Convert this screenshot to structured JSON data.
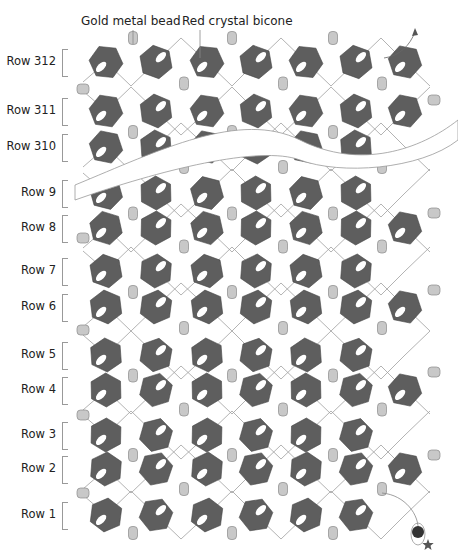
{
  "callouts": {
    "gold_bead": "Gold metal bead",
    "red_bicone": "Red crystal bicone"
  },
  "rows": [
    {
      "label": "Row 312",
      "y": 62
    },
    {
      "label": "Row 311",
      "y": 111
    },
    {
      "label": "Row 310",
      "y": 147
    },
    {
      "label": "Row 9",
      "y": 193
    },
    {
      "label": "Row 8",
      "y": 228
    },
    {
      "label": "Row 7",
      "y": 271
    },
    {
      "label": "Row 6",
      "y": 307
    },
    {
      "label": "Row 5",
      "y": 355
    },
    {
      "label": "Row 4",
      "y": 390
    },
    {
      "label": "Row 3",
      "y": 435
    },
    {
      "label": "Row 2",
      "y": 469
    },
    {
      "label": "Row 1",
      "y": 515
    }
  ],
  "colors": {
    "bicone": "#5e5e5e",
    "bicone_hole": "#ffffff",
    "gold_bead": "#c8c8c8",
    "gold_bead_stroke": "#8a8a8a",
    "thread": "#a0a0a0",
    "stopper_bead": "#333333",
    "star": "#555555"
  },
  "legend": {
    "bicone_icon": "hexagon",
    "bead_icon": "cylinder",
    "start_marker": "star-icon",
    "stop_bead": "dark-round-bead"
  }
}
